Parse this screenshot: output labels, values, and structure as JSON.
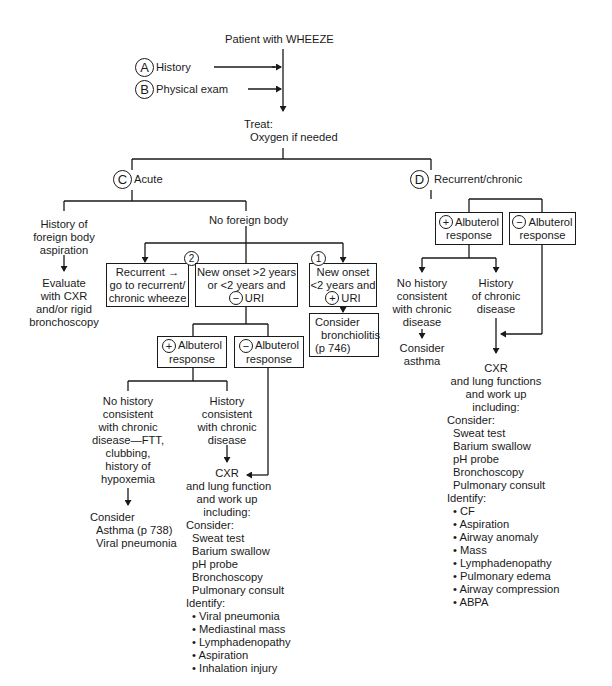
{
  "root": {
    "title": "Patient with WHEEZE"
  },
  "steps": [
    {
      "marker": "A",
      "label": "History"
    },
    {
      "marker": "B",
      "label": "Physical exam"
    }
  ],
  "treat": {
    "line1": "Treat:",
    "line2": "Oxygen if needed"
  },
  "acute": {
    "marker": "C",
    "label": "Acute",
    "foreign_body": {
      "label": [
        "History of",
        "foreign body",
        "aspiration"
      ],
      "action": [
        "Evaluate",
        "with CXR",
        "and/or rigid",
        "bronchoscopy"
      ]
    },
    "no_foreign_body": {
      "label": "No foreign body",
      "recurrent_box": {
        "marker": "2",
        "lines": [
          "Recurrent →",
          "go to recurrent/",
          "chronic wheeze"
        ]
      },
      "new_onset_neg": {
        "lines": [
          "New onset >2 years",
          "or <2 years and"
        ],
        "sign": "−",
        "tail": "URI"
      },
      "new_onset_pos": {
        "marker": "1",
        "lines": [
          "New onset",
          "<2 years and"
        ],
        "sign": "+",
        "tail": "URI"
      },
      "bronchiolitis": {
        "lines": [
          "Consider",
          "bronchiolitis",
          "(p 746)"
        ]
      },
      "albuterol_pos": {
        "sign": "+",
        "line1": "Albuterol",
        "line2": "response"
      },
      "albuterol_neg": {
        "sign": "−",
        "line1": "Albuterol",
        "line2": "response"
      },
      "no_history": [
        "No history",
        "consistent",
        "with chronic",
        "disease—FTT,",
        "clubbing,",
        "history of",
        "hypoxemia"
      ],
      "consider": {
        "title": "Consider",
        "items": [
          "Asthma (p 738)",
          "Viral pneumonia"
        ]
      },
      "history": [
        "History",
        "consistent",
        "with chronic",
        "disease"
      ],
      "workup": {
        "header": [
          "CXR",
          "and lung function",
          "and work up",
          "including:"
        ],
        "consider_label": "Consider:",
        "consider_items": [
          "Sweat test",
          "Barium swallow",
          "pH probe",
          "Bronchoscopy",
          "Pulmonary consult"
        ],
        "identify_label": "Identify:",
        "identify_items": [
          "Viral pneumonia",
          "Mediastinal mass",
          "Lymphadenopathy",
          "Aspiration",
          "Inhalation injury"
        ]
      }
    }
  },
  "chronic": {
    "marker": "D",
    "label": "Recurrent/chronic",
    "albuterol_pos": {
      "sign": "+",
      "line1": "Albuterol",
      "line2": "response"
    },
    "albuterol_neg": {
      "sign": "−",
      "line1": "Albuterol",
      "line2": "response"
    },
    "no_history": [
      "No history",
      "consistent",
      "with chronic",
      "disease"
    ],
    "consider_asthma": [
      "Consider",
      "asthma"
    ],
    "history": [
      "History",
      "of chronic",
      "disease"
    ],
    "workup": {
      "header": [
        "CXR",
        "and lung functions",
        "and work up",
        "including:"
      ],
      "consider_label": "Consider:",
      "consider_items": [
        "Sweat test",
        "Barium swallow",
        "pH probe",
        "Bronchoscopy",
        "Pulmonary consult"
      ],
      "identify_label": "Identify:",
      "identify_items": [
        "CF",
        "Aspiration",
        "Airway anomaly",
        "Mass",
        "Lymphadenopathy",
        "Pulmonary edema",
        "Airway compression",
        "ABPA"
      ]
    }
  },
  "bullet": "•"
}
